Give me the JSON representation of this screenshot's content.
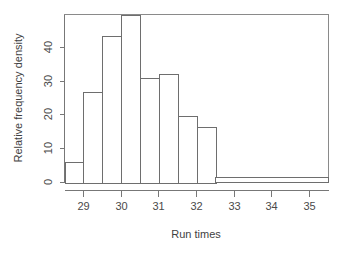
{
  "chart_data": {
    "type": "bar",
    "title": "",
    "subtitle": "",
    "xlabel": "Run times",
    "ylabel": "Relative frequency density",
    "grid": false,
    "legend": false,
    "legend_position": "none",
    "xlim": [
      28.5,
      35.5
    ],
    "ylim": [
      0,
      48
    ],
    "xticks": [
      29,
      30,
      31,
      32,
      33,
      34,
      35
    ],
    "xtick_labels": [
      "29",
      "30",
      "31",
      "32",
      "33",
      "34",
      "35"
    ],
    "yticks": [
      0,
      10,
      20,
      30,
      40
    ],
    "ytick_labels": [
      "0",
      "10",
      "20",
      "30",
      "40"
    ],
    "bin_edges": [
      28.5,
      29.0,
      29.5,
      30.0,
      30.5,
      31.0,
      31.5,
      32.0,
      32.5,
      35.5
    ],
    "values": [
      6,
      26,
      42,
      48,
      30,
      31,
      19,
      16,
      1.5
    ],
    "categories": [
      "28.5-29.0",
      "29.0-29.5",
      "29.5-30.0",
      "30.0-30.5",
      "30.5-31.0",
      "31.0-31.5",
      "31.5-32.0",
      "32.0-32.5",
      "32.5-35.5"
    ],
    "bar_fill": "#ffffff",
    "bar_stroke": "#6e6e6e",
    "axis_color": "#777777",
    "text_color": "#444444",
    "background": "#ffffff"
  }
}
